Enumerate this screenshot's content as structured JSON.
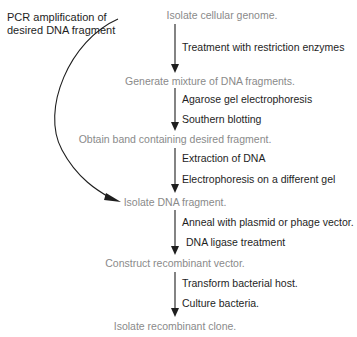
{
  "diagram": {
    "steps": [
      {
        "text": "Isolate cellular genome."
      },
      {
        "text": "Generate mixture of DNA fragments."
      },
      {
        "text": "Obtain band containing desired fragment."
      },
      {
        "text": "Isolate DNA fragment."
      },
      {
        "text": "Construct recombinant vector."
      },
      {
        "text": "Isolate recombinant clone."
      }
    ],
    "transitions": [
      {
        "labels": [
          "Treatment with restriction enzymes"
        ]
      },
      {
        "labels": [
          "Agarose gel electrophoresis",
          "Southern blotting"
        ]
      },
      {
        "labels": [
          "Extraction of DNA",
          "Electrophoresis on a different gel"
        ]
      },
      {
        "labels": [
          "Anneal with plasmid or phage vector.",
          "DNA ligase treatment"
        ]
      },
      {
        "labels": [
          "Transform bacterial host.",
          "Culture bacteria."
        ]
      }
    ],
    "shortcut": {
      "label": "PCR amplification of desired DNA fragment",
      "from_step": "Isolate cellular genome.",
      "to_step": "Isolate DNA fragment."
    },
    "colors": {
      "step_text": "#8a8a8a",
      "label_text": "#1e1e1e",
      "arrow": "#1e1e1e"
    }
  }
}
